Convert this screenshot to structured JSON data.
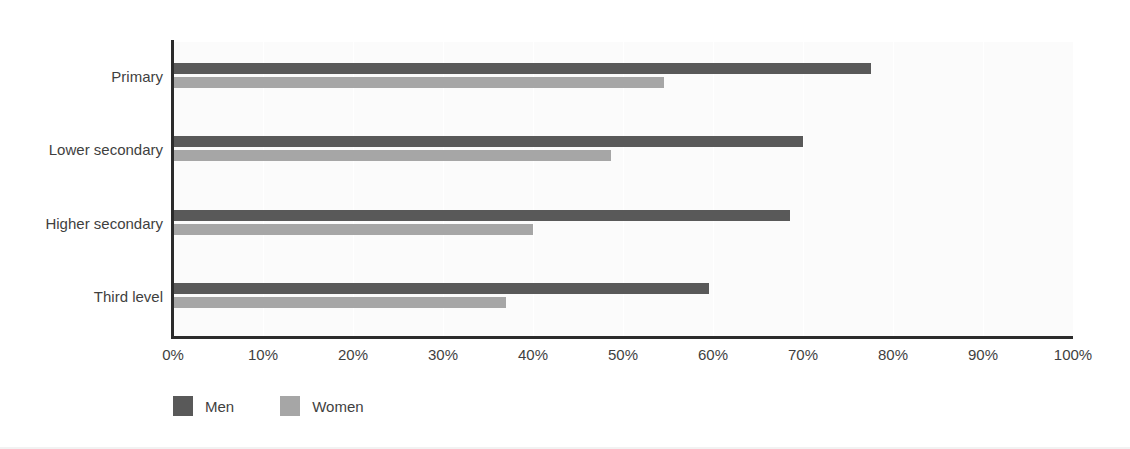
{
  "chart_data": {
    "type": "bar",
    "orientation": "horizontal",
    "title": "",
    "xlabel": "",
    "ylabel": "",
    "xlim": [
      0,
      100
    ],
    "x_tick_labels": [
      "0%",
      "10%",
      "20%",
      "30%",
      "40%",
      "50%",
      "60%",
      "70%",
      "80%",
      "90%",
      "100%"
    ],
    "x_tick_values": [
      0,
      10,
      20,
      30,
      40,
      50,
      60,
      70,
      80,
      90,
      100
    ],
    "grid": true,
    "grid_axis": "x",
    "legend_position": "bottom-left",
    "categories": [
      "Primary",
      "Lower secondary",
      "Higher secondary",
      "Third level"
    ],
    "series": [
      {
        "name": "Men",
        "color": "#595959",
        "values": [
          77.5,
          70.0,
          68.5,
          59.5
        ]
      },
      {
        "name": "Women",
        "color": "#a6a6a6",
        "values": [
          54.5,
          48.7,
          40.0,
          37.0
        ]
      }
    ]
  },
  "legend": {
    "items": [
      {
        "label": "Men",
        "color": "#595959"
      },
      {
        "label": "Women",
        "color": "#a6a6a6"
      }
    ]
  },
  "colors": {
    "men": "#595959",
    "women": "#a6a6a6",
    "axis": "#2b2b2b",
    "plot_background": "#fbfbfb",
    "gridline": "#ffffff",
    "text": "#3f3f3f"
  }
}
